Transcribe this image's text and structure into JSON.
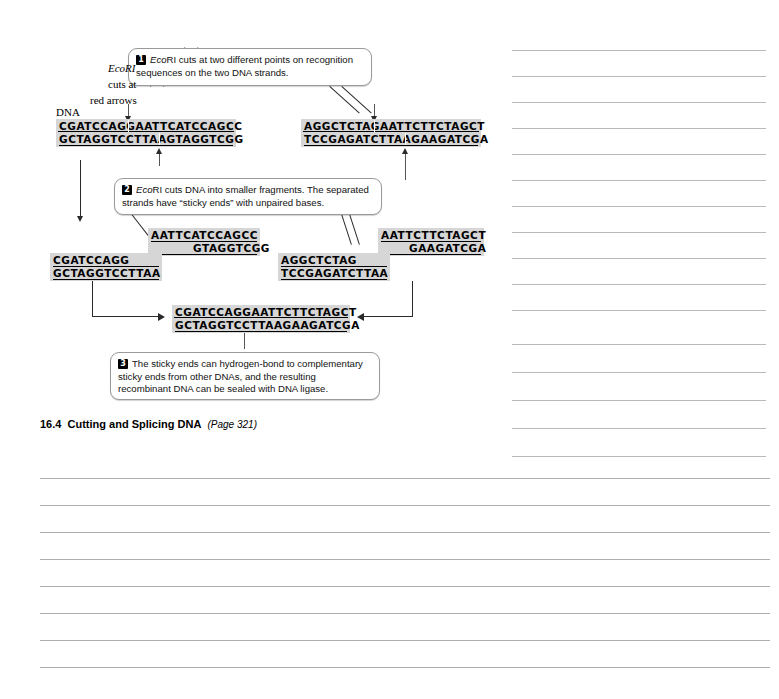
{
  "figure": {
    "caption_number": "16.4",
    "caption_title": "Cutting and Splicing DNA",
    "caption_page": "(Page 321)",
    "dna_label": "DNA",
    "enzyme_note_line1": "EcoRI",
    "enzyme_note_line2": "cuts at",
    "enzyme_note_line3": "red arrows"
  },
  "steps": [
    {
      "number": "1",
      "lead_italic": "Eco",
      "lead_rest": "RI",
      "text": " cuts at two different points on recognition sequences on the two DNA strands."
    },
    {
      "number": "2",
      "lead_italic": "Eco",
      "lead_rest": "RI",
      "text": " cuts DNA into smaller fragments. The separated strands have “sticky ends” with unpaired bases."
    },
    {
      "number": "3",
      "lead_italic": "",
      "lead_rest": "",
      "text": "The sticky ends can hydrogen-bond to complementary sticky ends from other DNAs, and the resulting recombinant DNA can be sealed with DNA ligase."
    }
  ],
  "sequences": {
    "intact_left": {
      "name": "intact-dna-left",
      "top": "CGATCCAGGAATTCATCCAGCC",
      "bottom": "GCTAGGTCCTTAAGTAGGTCGG"
    },
    "intact_right": {
      "name": "intact-dna-right",
      "top": "AGGCTCTAGAATTCTTCTAGCT",
      "bottom": "TCCGAGATCTTAAGAAGATCGA"
    },
    "fragment_a": {
      "name": "fragment-sticky-aattcatccagcc",
      "top": "AATTCATCCAGCC",
      "bottom": "GTAGGTCGG"
    },
    "fragment_b": {
      "name": "fragment-cgatccagg",
      "top": "CGATCCAGG",
      "bottom": "GCTAGGTCCTTAA"
    },
    "fragment_c": {
      "name": "fragment-aggctctag",
      "top": "AGGCTCTAG",
      "bottom": "TCCGAGATCTTAA"
    },
    "fragment_d": {
      "name": "fragment-sticky-aattcttctagct",
      "top": "AATTCTTCTAGCT",
      "bottom": "GAAGATCGA"
    },
    "recombinant": {
      "name": "recombinant-dna",
      "top": "CGATCCAGGAATTCTTCTAGCT",
      "bottom": "GCTAGGTCCTTAAGAAGATCGA"
    }
  },
  "colors": {
    "sequence_background": "#d6d6d6",
    "rule_line": "#b9b9b9",
    "callout_border": "#9a9a9a",
    "connector": "#2a2a2a"
  },
  "notes_area": {
    "right_column_line_count": 16,
    "bottom_line_count": 8
  }
}
